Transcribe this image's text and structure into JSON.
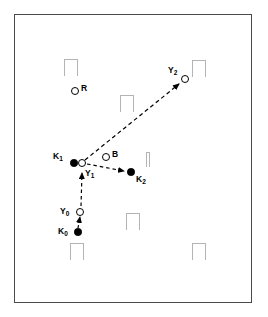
{
  "figure": {
    "width": 268,
    "height": 317,
    "background_color": "#ffffff",
    "frame_color": "#4a4a4a",
    "obstacle_color": "#b4b4b4",
    "path_color": "#000000"
  },
  "nodes": [
    {
      "id": "K0",
      "label": "K",
      "subscript": "0",
      "marker": "filled-circle",
      "x": 78,
      "y": 232,
      "label_x": 58,
      "label_y": 227
    },
    {
      "id": "Y0",
      "label": "Y",
      "subscript": "0",
      "marker": "open-circle",
      "x": 80,
      "y": 212,
      "label_x": 60,
      "label_y": 207
    },
    {
      "id": "K1",
      "label": "K",
      "subscript": "1",
      "marker": "filled-circle",
      "x": 74,
      "y": 163,
      "label_x": 53,
      "label_y": 152
    },
    {
      "id": "Y1",
      "label": "Y",
      "subscript": "1",
      "marker": "open-circle",
      "x": 82,
      "y": 163,
      "label_x": 85,
      "label_y": 169
    },
    {
      "id": "K2",
      "label": "K",
      "subscript": "2",
      "marker": "filled-circle",
      "x": 131,
      "y": 172,
      "label_x": 136,
      "label_y": 175
    },
    {
      "id": "Y2",
      "label": "Y",
      "subscript": "2",
      "marker": "open-circle",
      "x": 185,
      "y": 79,
      "label_x": 168,
      "label_y": 66
    },
    {
      "id": "R",
      "label": "R",
      "subscript": "",
      "marker": "open-circle",
      "x": 75,
      "y": 91,
      "label_x": 81,
      "label_y": 84
    },
    {
      "id": "B",
      "label": "B",
      "subscript": "",
      "marker": "open-circle",
      "x": 106,
      "y": 157,
      "label_x": 112,
      "label_y": 150
    }
  ],
  "paths": [
    {
      "id": "k0-to-y0",
      "from": "K0",
      "to": "Y0",
      "style": "dashed",
      "arrow": true
    },
    {
      "id": "y0-to-y1",
      "from": "Y0",
      "to": "Y1",
      "style": "dashed",
      "arrow": true
    },
    {
      "id": "y1-to-k2",
      "from": "Y1",
      "to": "K2",
      "style": "dashed",
      "arrow": true
    },
    {
      "id": "y1-to-y2",
      "from": "Y1",
      "to": "Y2",
      "style": "dashed",
      "arrow": true
    }
  ],
  "obstacles": [
    {
      "id": "obstacle-top-left",
      "shape": "pi",
      "x": 64,
      "y": 59,
      "width": 14,
      "height": 17
    },
    {
      "id": "obstacle-top-right",
      "shape": "pi",
      "x": 192,
      "y": 60,
      "width": 14,
      "height": 17
    },
    {
      "id": "obstacle-upper-middle",
      "shape": "pi",
      "x": 120,
      "y": 95,
      "width": 14,
      "height": 17
    },
    {
      "id": "obstacle-center-bar",
      "shape": "bar",
      "x": 146,
      "y": 152,
      "width": 4,
      "height": 15
    },
    {
      "id": "obstacle-lower-middle",
      "shape": "pi",
      "x": 126,
      "y": 213,
      "width": 14,
      "height": 17
    },
    {
      "id": "obstacle-bottom-left",
      "shape": "pi",
      "x": 70,
      "y": 243,
      "width": 14,
      "height": 17
    },
    {
      "id": "obstacle-bottom-right",
      "shape": "pi",
      "x": 192,
      "y": 243,
      "width": 14,
      "height": 17
    }
  ],
  "chart_data": {
    "type": "scatter",
    "xlabel": "",
    "ylabel": "",
    "xlim": [
      14,
      252
    ],
    "ylim": [
      14,
      303
    ],
    "grid": false,
    "legend": "none",
    "series": [
      {
        "name": "Robot poses (filled)",
        "marker": "filled-circle",
        "points": [
          {
            "label": "K0",
            "x": 78,
            "y": 232
          },
          {
            "label": "K1",
            "x": 74,
            "y": 163
          },
          {
            "label": "K2",
            "x": 131,
            "y": 172
          }
        ]
      },
      {
        "name": "Estimated positions (open)",
        "marker": "open-circle",
        "points": [
          {
            "label": "Y0",
            "x": 80,
            "y": 212
          },
          {
            "label": "Y1",
            "x": 82,
            "y": 163
          },
          {
            "label": "Y2",
            "x": 185,
            "y": 79
          }
        ]
      },
      {
        "name": "Landmarks",
        "marker": "open-circle",
        "points": [
          {
            "label": "R",
            "x": 75,
            "y": 91
          },
          {
            "label": "B",
            "x": 106,
            "y": 157
          }
        ]
      }
    ],
    "annotations": [
      {
        "text": "K0",
        "x": 78,
        "y": 232
      },
      {
        "text": "Y0",
        "x": 80,
        "y": 212
      },
      {
        "text": "K1",
        "x": 74,
        "y": 163
      },
      {
        "text": "Y1",
        "x": 82,
        "y": 163
      },
      {
        "text": "K2",
        "x": 131,
        "y": 172
      },
      {
        "text": "Y2",
        "x": 185,
        "y": 79
      },
      {
        "text": "R",
        "x": 75,
        "y": 91
      },
      {
        "text": "B",
        "x": 106,
        "y": 157
      }
    ]
  }
}
